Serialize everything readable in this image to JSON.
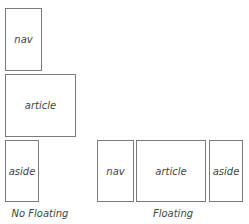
{
  "diagram": {
    "no_floating": {
      "caption": "No Floating",
      "boxes": [
        {
          "label": "nav"
        },
        {
          "label": "article"
        },
        {
          "label": "aside"
        }
      ]
    },
    "floating": {
      "caption": "Floating",
      "boxes": [
        {
          "label": "nav"
        },
        {
          "label": "article"
        },
        {
          "label": "aside"
        }
      ]
    },
    "colors": {
      "border": "#7a7a7a",
      "text": "#444444",
      "background": "#ffffff"
    }
  }
}
